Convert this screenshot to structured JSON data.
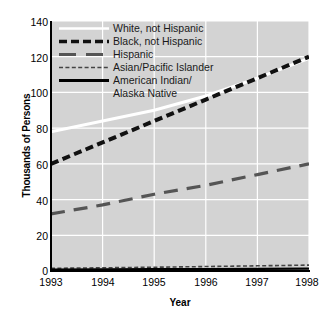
{
  "chart_data": {
    "type": "line",
    "title": "",
    "xlabel": "Year",
    "ylabel": "Thousands of Persons",
    "x": [
      1993,
      1994,
      1995,
      1996,
      1997,
      1998
    ],
    "xticklabels": [
      "1993",
      "1994",
      "1995",
      "1996",
      "1997",
      "1998"
    ],
    "yticklabels": [
      "0",
      "20",
      "40",
      "60",
      "80",
      "100",
      "120",
      "140"
    ],
    "yticks": [
      0,
      20,
      40,
      60,
      80,
      100,
      120,
      140
    ],
    "xlim": [
      1993,
      1998
    ],
    "ylim": [
      0,
      140
    ],
    "grid": true,
    "grid_color": "#ffffff",
    "plot_background": "#d3d3d3",
    "legend_position": "upper-left-inside",
    "series": [
      {
        "name": "White, not Hispanic",
        "values": [
          78,
          84,
          90,
          98,
          108,
          119
        ],
        "color": "#ffffff",
        "style": "solid",
        "width": 3
      },
      {
        "name": "Black, not Hispanic",
        "values": [
          60,
          72,
          84,
          96,
          108,
          120
        ],
        "color": "#111111",
        "style": "dashed",
        "width": 4
      },
      {
        "name": "Hispanic",
        "values": [
          32,
          37,
          43,
          48,
          54,
          60
        ],
        "color": "#555555",
        "style": "dashed",
        "width": 3.2
      },
      {
        "name": "Asian/Pacific Islander",
        "values": [
          1.5,
          1.8,
          2.1,
          2.5,
          2.9,
          3.3
        ],
        "color": "#444444",
        "style": "fine-dashed",
        "width": 1.6
      },
      {
        "name": "American Indian/\nAlaska Native",
        "values": [
          0.8,
          0.9,
          1.0,
          1.1,
          1.2,
          1.3
        ],
        "color": "#000000",
        "style": "solid",
        "width": 2.2
      }
    ]
  },
  "legend": {
    "entries": [
      {
        "label": "White, not Hispanic",
        "swatch": "solid-white-line-swatch"
      },
      {
        "label": "Black, not Hispanic",
        "swatch": "black-dashed-line-swatch"
      },
      {
        "label": "Hispanic",
        "swatch": "gray-dashed-line-swatch"
      },
      {
        "label": "Asian/Pacific Islander",
        "swatch": "fine-dashed-line-swatch"
      },
      {
        "label": "American Indian/",
        "label2": "Alaska Native",
        "swatch": "solid-black-line-swatch"
      }
    ]
  },
  "axes": {
    "x_title": "Year",
    "y_title": "Thousands of Persons",
    "y_ticks": [
      "140",
      "120",
      "100",
      "80",
      "60",
      "40",
      "20",
      "0"
    ],
    "x_ticks": [
      "1993",
      "1994",
      "1995",
      "1996",
      "1997",
      "1998"
    ]
  }
}
